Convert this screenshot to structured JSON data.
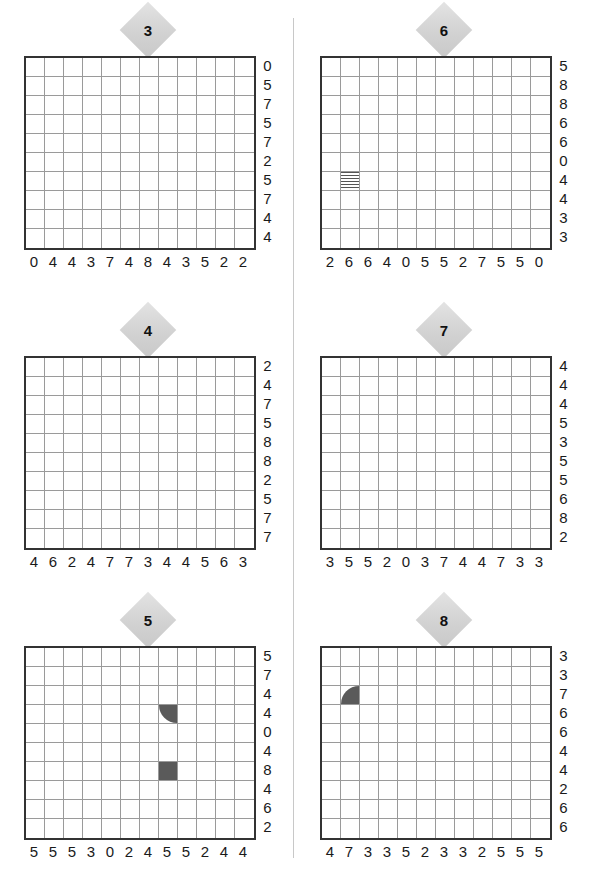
{
  "layout": {
    "grid_columns": 12,
    "grid_rows": 10,
    "panel_columns": 2,
    "panel_rows": 3,
    "divider": true
  },
  "colors": {
    "badge_fill": "#d2d2d2",
    "grid_border": "#333333",
    "grid_line": "#9a9a9a",
    "shape_fill": "#5a5a5a",
    "label_text": "#1a1a1a",
    "divider": "#c8c8c8",
    "background": "#ffffff"
  },
  "panels": [
    {
      "id": "panel-3",
      "badge": "3",
      "row_labels": [
        "0",
        "5",
        "7",
        "5",
        "7",
        "2",
        "5",
        "7",
        "4",
        "4"
      ],
      "col_labels": [
        "0",
        "4",
        "4",
        "3",
        "7",
        "4",
        "8",
        "4",
        "3",
        "5",
        "2",
        "2"
      ],
      "shapes": []
    },
    {
      "id": "panel-6",
      "badge": "6",
      "row_labels": [
        "5",
        "8",
        "8",
        "6",
        "6",
        "0",
        "4",
        "4",
        "3",
        "3"
      ],
      "col_labels": [
        "2",
        "6",
        "6",
        "4",
        "0",
        "5",
        "5",
        "2",
        "7",
        "5",
        "5",
        "0"
      ],
      "shapes": [
        {
          "name": "wave-cell",
          "row": 7,
          "col": 2,
          "kind": "wave"
        }
      ]
    },
    {
      "id": "panel-4",
      "badge": "4",
      "row_labels": [
        "2",
        "4",
        "7",
        "5",
        "8",
        "8",
        "2",
        "5",
        "7",
        "7"
      ],
      "col_labels": [
        "4",
        "6",
        "2",
        "4",
        "7",
        "7",
        "3",
        "4",
        "4",
        "5",
        "6",
        "3"
      ],
      "shapes": []
    },
    {
      "id": "panel-7",
      "badge": "7",
      "row_labels": [
        "4",
        "4",
        "4",
        "5",
        "3",
        "5",
        "5",
        "6",
        "8",
        "2"
      ],
      "col_labels": [
        "3",
        "5",
        "5",
        "2",
        "0",
        "3",
        "7",
        "4",
        "4",
        "7",
        "3",
        "3"
      ],
      "shapes": []
    },
    {
      "id": "panel-5",
      "badge": "5",
      "row_labels": [
        "5",
        "7",
        "4",
        "4",
        "0",
        "4",
        "8",
        "4",
        "6",
        "2"
      ],
      "col_labels": [
        "5",
        "5",
        "5",
        "3",
        "0",
        "2",
        "4",
        "5",
        "5",
        "2",
        "4",
        "4"
      ],
      "shapes": [
        {
          "name": "quarter-disc-bottom-left",
          "row": 4,
          "col": 8,
          "kind": "quarter-bl"
        },
        {
          "name": "filled-square",
          "row": 7,
          "col": 8,
          "kind": "square"
        }
      ]
    },
    {
      "id": "panel-8",
      "badge": "8",
      "row_labels": [
        "3",
        "3",
        "7",
        "6",
        "6",
        "4",
        "4",
        "2",
        "6",
        "6"
      ],
      "col_labels": [
        "4",
        "7",
        "3",
        "3",
        "5",
        "2",
        "3",
        "3",
        "2",
        "5",
        "5",
        "5"
      ],
      "shapes": [
        {
          "name": "quarter-disc-top-left",
          "row": 3,
          "col": 2,
          "kind": "quarter-tl"
        }
      ]
    }
  ]
}
